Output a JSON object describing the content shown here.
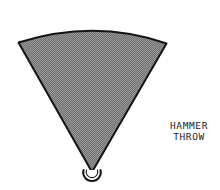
{
  "diagram": {
    "background_color": "#ffffff",
    "label": {
      "line1": "HAMMER",
      "line2": "THROW"
    },
    "label_color": "#1c1c1c",
    "sector": {
      "name": "landing-sector",
      "fill_color": "#808080",
      "fill_pattern": "checkerboard-dither-50",
      "pattern_light": "#b4b4b4",
      "pattern_dark": "#585858",
      "stroke_color": "#141414",
      "stroke_width": 2,
      "apex": {
        "x": 92,
        "y": 172
      },
      "left_vertex": {
        "x": 18,
        "y": 42
      },
      "right_vertex": {
        "x": 167,
        "y": 43
      },
      "arc_peak": {
        "x": 95,
        "y": 19
      },
      "sector_angle_deg": 60
    },
    "cage": {
      "name": "throwing-cage-arc",
      "stroke_color": "#141414",
      "stroke_width": 2,
      "fill_color": "#ffffff",
      "center": {
        "x": 92,
        "y": 172
      },
      "radius": 9,
      "opening_direction": "up"
    }
  }
}
